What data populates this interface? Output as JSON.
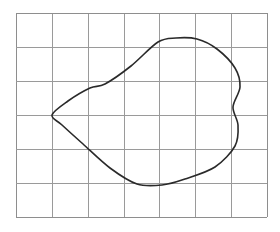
{
  "figure": {
    "background_color": "#ffffff",
    "canvas": {
      "width": 280,
      "height": 232
    }
  },
  "chart_data": {
    "type": "line",
    "title": "",
    "subtitle": "",
    "xlabel": "",
    "ylabel": "",
    "grid": true,
    "legend": false,
    "legend_position": "none",
    "xlim": [
      0,
      7
    ],
    "ylim": [
      0,
      6
    ],
    "xticks": [
      0,
      1,
      2,
      3,
      4,
      5,
      6,
      7
    ],
    "yticks": [
      0,
      1,
      2,
      3,
      4,
      5,
      6
    ],
    "xticklabels": [
      "",
      "",
      "",
      "",
      "",
      "",
      "",
      ""
    ],
    "yticklabels": [
      "",
      "",
      "",
      "",
      "",
      ""
    ],
    "grid_columns": 7,
    "grid_rows": 6,
    "grid_color": "#9a9a9a",
    "grid_line_width": 1,
    "series": [
      {
        "name": "closed-curve",
        "closed": true,
        "color": "#2a2a2a",
        "line_width": 1.6,
        "fill": "none",
        "points_grid_units": [
          [
            1.0,
            3.0
          ],
          [
            1.45,
            2.6
          ],
          [
            2.05,
            2.22
          ],
          [
            2.48,
            2.08
          ],
          [
            3.2,
            1.55
          ],
          [
            3.95,
            0.86
          ],
          [
            4.45,
            0.72
          ],
          [
            5.05,
            0.78
          ],
          [
            5.6,
            1.05
          ],
          [
            6.1,
            1.6
          ],
          [
            6.25,
            2.15
          ],
          [
            6.05,
            2.72
          ],
          [
            6.2,
            3.25
          ],
          [
            6.1,
            3.85
          ],
          [
            5.55,
            4.48
          ],
          [
            4.7,
            4.82
          ],
          [
            4.05,
            5.05
          ],
          [
            3.35,
            5.02
          ],
          [
            2.6,
            4.55
          ],
          [
            1.85,
            3.85
          ],
          [
            1.25,
            3.3
          ],
          [
            1.0,
            3.0
          ]
        ],
        "points_pixels": [
          [
            52,
            115
          ],
          [
            68,
            101
          ],
          [
            90,
            88
          ],
          [
            105,
            84
          ],
          [
            131,
            66
          ],
          [
            158,
            42
          ],
          [
            176,
            38
          ],
          [
            197,
            39
          ],
          [
            217,
            49
          ],
          [
            235,
            68
          ],
          [
            240,
            87
          ],
          [
            233,
            107
          ],
          [
            238,
            125
          ],
          [
            235,
            146
          ],
          [
            215,
            167
          ],
          [
            185,
            179
          ],
          [
            162,
            185
          ],
          [
            137,
            184
          ],
          [
            110,
            168
          ],
          [
            83,
            144
          ],
          [
            62,
            125
          ],
          [
            52,
            115
          ]
        ],
        "extrema": {
          "leftmost": [
            52,
            115
          ],
          "rightmost": [
            240,
            87
          ],
          "topmost": [
            190,
            38
          ],
          "bottommost": [
            160,
            185
          ]
        },
        "features": [
          "cusp at left vertex on grid intersection",
          "concave dip along upper-left edge",
          "S-shaped wiggle along right edge",
          "broad rounded top",
          "smooth rounded bottom"
        ]
      }
    ]
  },
  "grid": {
    "origin_px": {
      "x": 16,
      "y": 13
    },
    "cell_width_px": 35.86,
    "cell_height_px": 34.0,
    "columns": 7,
    "rows": 6,
    "color": "#9a9a9a",
    "border_color": "#8e8e8e"
  },
  "curve": {
    "stroke_color": "#2a2a2a",
    "stroke_width": 1.6
  }
}
